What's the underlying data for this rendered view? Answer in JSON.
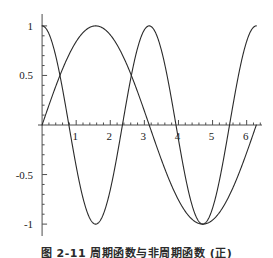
{
  "figure": {
    "caption": "图 2-11   周期函数与非周期函数 (正)",
    "background_color": "#ffffff",
    "curve_color": "#2a2a2a",
    "axis_color": "#4d4d4d"
  },
  "chart_data": {
    "type": "line",
    "title": "",
    "subtitle": "",
    "xlabel": "",
    "ylabel": "",
    "xlim": [
      -0.12,
      6.45
    ],
    "ylim": [
      -1.12,
      1.12
    ],
    "grid": false,
    "legend": null,
    "legend_position": "none",
    "axis_style": "centered-cross",
    "x_ticks_major": [
      1,
      2,
      3,
      4,
      5,
      6
    ],
    "x_tick_labels": [
      "1",
      "2",
      "3",
      "4",
      "5",
      "6"
    ],
    "x_minor_ticks_per_major": 5,
    "y_ticks_major": [
      -1,
      -0.5,
      0.5,
      1
    ],
    "y_tick_labels": [
      "-1",
      "-0.5",
      "0.5",
      "1"
    ],
    "y_minor_ticks_per_major": 5,
    "series": [
      {
        "name": "sin(x)",
        "expression": "sin(x)",
        "color": "#2a2a2a",
        "x": [
          0,
          0.2,
          0.4,
          0.6,
          0.7854,
          1,
          1.2,
          1.4,
          1.5708,
          1.8,
          2,
          2.2,
          2.4,
          2.6,
          2.8,
          3,
          3.1416,
          3.4,
          3.6,
          3.8,
          4,
          4.2,
          4.4,
          4.7124,
          5,
          5.2,
          5.4,
          5.6,
          5.8,
          6,
          6.2,
          6.2832
        ],
        "values": [
          0,
          0.1987,
          0.3894,
          0.5646,
          0.7071,
          0.8415,
          0.932,
          0.9854,
          1,
          0.9738,
          0.9093,
          0.8085,
          0.6755,
          0.5155,
          0.335,
          0.1411,
          0,
          -0.2555,
          -0.4425,
          -0.6119,
          -0.7568,
          -0.8716,
          -0.9516,
          -1,
          -0.9589,
          -0.8835,
          -0.7728,
          -0.6313,
          -0.4646,
          -0.2794,
          -0.0831,
          0
        ]
      },
      {
        "name": "cos(2x)",
        "expression": "cos(2x)",
        "color": "#2a2a2a",
        "x": [
          0,
          0.2,
          0.4,
          0.6,
          0.7854,
          1,
          1.2,
          1.4,
          1.5708,
          1.8,
          2,
          2.2,
          2.4,
          2.6,
          2.8,
          3,
          3.1416,
          3.4,
          3.6,
          3.8,
          4,
          4.2,
          4.4,
          4.7124,
          5,
          5.2,
          5.4,
          5.6,
          5.8,
          6,
          6.2,
          6.2832
        ],
        "values": [
          1,
          0.9211,
          0.6967,
          0.3624,
          0,
          -0.4161,
          -0.7374,
          -0.9422,
          -1,
          -0.8727,
          -0.6536,
          -0.3549,
          -0.0292,
          0.3392,
          0.6603,
          0.9602,
          1,
          0.7361,
          0.4686,
          0.1367,
          -0.1455,
          -0.4903,
          -0.7597,
          -1,
          -0.8391,
          -0.5885,
          -0.2752,
          0.0752,
          0.4176,
          0.8439,
          0.9839,
          1
        ]
      }
    ],
    "key_points": {
      "intersections_label": "curves cross at y = 0.5",
      "intersections": [
        [
          0.5236,
          0.5
        ],
        [
          2.618,
          0.5
        ]
      ],
      "maxima": [
        [
          0,
          1
        ],
        [
          1.5708,
          1
        ],
        [
          3.1416,
          1
        ],
        [
          6.2832,
          1
        ]
      ],
      "minima": [
        [
          1.5708,
          -1
        ],
        [
          4.7124,
          -1
        ]
      ]
    }
  }
}
